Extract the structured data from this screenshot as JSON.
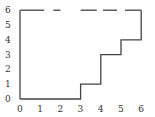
{
  "chart_data": {
    "type": "line",
    "title": "",
    "xlabel": "",
    "ylabel": "",
    "xlim": [
      0,
      6
    ],
    "ylim": [
      0,
      6
    ],
    "grid": false,
    "x_ticks": [
      "0",
      "1",
      "2",
      "3",
      "4",
      "5",
      "6"
    ],
    "y_ticks": [
      "0",
      "1",
      "2",
      "3",
      "4",
      "5",
      "6"
    ],
    "series": [
      {
        "name": "staircase boundary",
        "style": "solid",
        "points": [
          [
            0,
            0
          ],
          [
            3,
            0
          ],
          [
            3,
            1
          ],
          [
            4,
            1
          ],
          [
            4,
            3
          ],
          [
            5,
            3
          ],
          [
            5,
            4
          ],
          [
            6,
            4
          ],
          [
            6,
            6
          ]
        ]
      },
      {
        "name": "left edge",
        "style": "solid",
        "points": [
          [
            0,
            0
          ],
          [
            0,
            6
          ]
        ]
      },
      {
        "name": "top edge",
        "style": "dashed",
        "segments": [
          [
            0,
            1.2
          ],
          [
            1.65,
            2.0
          ],
          [
            3.0,
            3.8
          ],
          [
            4.1,
            4.8
          ],
          [
            5.2,
            6.0
          ]
        ],
        "y": 6
      }
    ],
    "line_color": "#444444"
  }
}
